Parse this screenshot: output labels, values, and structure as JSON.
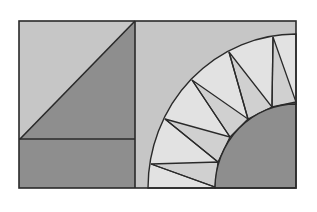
{
  "diagram": {
    "colors": {
      "background": "#ffffff",
      "light": "#c6c6c6",
      "pale": "#e2e2e2",
      "mid": "#d0d0d0",
      "dark": "#8e8e8e",
      "line": "#2a2a2a"
    },
    "frame": {
      "x": 19,
      "y": 21,
      "w": 277,
      "h": 167
    },
    "left_panel": {
      "divider_x": 135,
      "horizontal_y": 139,
      "shapes": [
        "light-upper-left-triangle",
        "dark-lower-right-triangle",
        "dark-bottom-strip"
      ]
    },
    "right_panel": {
      "arc_center": [
        296,
        188
      ],
      "outer_radius": 150,
      "inner_radius": 83,
      "spike_count": 5
    }
  }
}
